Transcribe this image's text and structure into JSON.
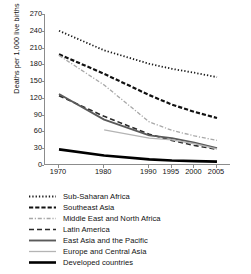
{
  "chart_data": {
    "type": "line",
    "title": "",
    "xlabel": "",
    "ylabel": "Deaths per 1,000 live births",
    "categories": [
      "1970",
      "1980",
      "1990",
      "1995",
      "2000",
      "2005"
    ],
    "ylim": [
      0,
      270
    ],
    "yticks": [
      0,
      30,
      60,
      90,
      120,
      150,
      180,
      210,
      240,
      270
    ],
    "grid": false,
    "legend_position": "below",
    "series": [
      {
        "name": "Sub-Saharan Africa",
        "style": "dotted",
        "color": "#1a1a1a",
        "width": 1.8,
        "values": [
          240,
          205,
          181,
          172,
          165,
          157
        ]
      },
      {
        "name": "Southeast Asia",
        "style": "dashed-thick",
        "color": "#111111",
        "width": 2.2,
        "values": [
          198,
          163,
          125,
          108,
          95,
          84
        ]
      },
      {
        "name": "Middle East and North Africa",
        "style": "dash-dot-light",
        "color": "#a8a8a8",
        "width": 1.3,
        "values": [
          196,
          143,
          77,
          62,
          52,
          44
        ]
      },
      {
        "name": "Latin America",
        "style": "dashed",
        "color": "#2a2a2a",
        "width": 1.6,
        "values": [
          124,
          87,
          55,
          44,
          35,
          28
        ]
      },
      {
        "name": "East Asia and the Pacific",
        "style": "solid-medium",
        "color": "#5a5a5a",
        "width": 1.9,
        "values": [
          127,
          81,
          53,
          48,
          40,
          30
        ]
      },
      {
        "name": "Europe and Central Asia",
        "style": "solid-light",
        "color": "#b4b4b4",
        "width": 1.3,
        "values": [
          null,
          63,
          48,
          45,
          38,
          29
        ]
      },
      {
        "name": "Developed countries",
        "style": "solid-heavy",
        "color": "#000000",
        "width": 2.6,
        "values": [
          28,
          17,
          10,
          8,
          7,
          6
        ]
      }
    ]
  },
  "legend": {
    "items": [
      {
        "label": "Sub-Saharan Africa"
      },
      {
        "label": "Southeast Asia"
      },
      {
        "label": "Middle East and North Africa"
      },
      {
        "label": "Latin America"
      },
      {
        "label": "East Asia and the Pacific"
      },
      {
        "label": "Europe and Central Asia"
      },
      {
        "label": "Developed countries"
      }
    ]
  }
}
